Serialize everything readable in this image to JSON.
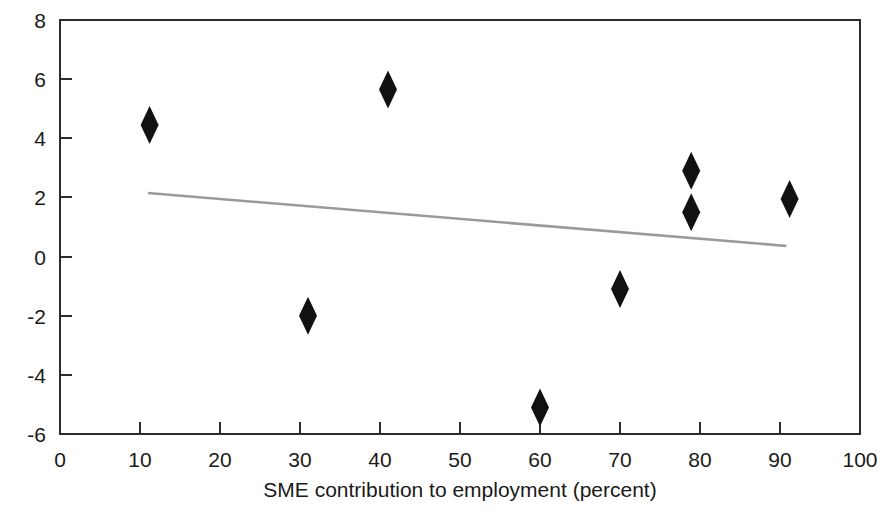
{
  "chart_data": {
    "type": "scatter",
    "title": "",
    "xlabel": "SME contribution to employment (percent)",
    "ylabel": "",
    "xlim": [
      0,
      100
    ],
    "ylim": [
      -6,
      8
    ],
    "xticks": [
      0,
      10,
      20,
      30,
      40,
      50,
      60,
      70,
      80,
      90,
      100
    ],
    "yticks": [
      -6,
      -4,
      -2,
      0,
      2,
      4,
      6,
      8
    ],
    "xtick_labels": [
      "0",
      "10",
      "20",
      "30",
      "40",
      "50",
      "60",
      "70",
      "80",
      "90",
      "100"
    ],
    "ytick_labels": [
      "-6",
      "-4",
      "-2",
      "0",
      "2",
      "4",
      "6",
      "8"
    ],
    "grid": false,
    "legend": null,
    "marker_shape": "diamond",
    "marker_color": "#111111",
    "points": [
      {
        "x": 11.2,
        "y": 4.45
      },
      {
        "x": 31.0,
        "y": -2.0
      },
      {
        "x": 41.0,
        "y": 5.65
      },
      {
        "x": 60.0,
        "y": -5.1
      },
      {
        "x": 70.0,
        "y": -1.1
      },
      {
        "x": 78.9,
        "y": 2.9
      },
      {
        "x": 78.9,
        "y": 1.5
      },
      {
        "x": 91.2,
        "y": 1.95
      }
    ],
    "series": [
      {
        "name": "observations",
        "x": [
          11.2,
          31.0,
          41.0,
          60.0,
          70.0,
          78.9,
          78.9,
          91.2
        ],
        "values": [
          4.45,
          -2.0,
          5.65,
          -5.1,
          -1.1,
          2.9,
          1.5,
          1.95
        ]
      }
    ],
    "trendline": {
      "name": "linear fit",
      "color": "#9a9a9a",
      "x_start": 11.0,
      "y_start": 2.15,
      "x_end": 90.8,
      "y_end": 0.36
    }
  },
  "axis": {
    "x_title": "SME contribution to employment (percent)"
  }
}
